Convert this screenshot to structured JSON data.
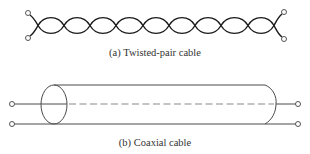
{
  "figure": {
    "twisted_pair": {
      "caption": "(a) Twisted-pair cable",
      "stroke_color": "#1a1a1a",
      "terminal_color": "#555555"
    },
    "coaxial": {
      "caption": "(b) Coaxial cable",
      "stroke_color": "#4a4a4a",
      "center_conductor_color": "#8a8a8a"
    }
  }
}
